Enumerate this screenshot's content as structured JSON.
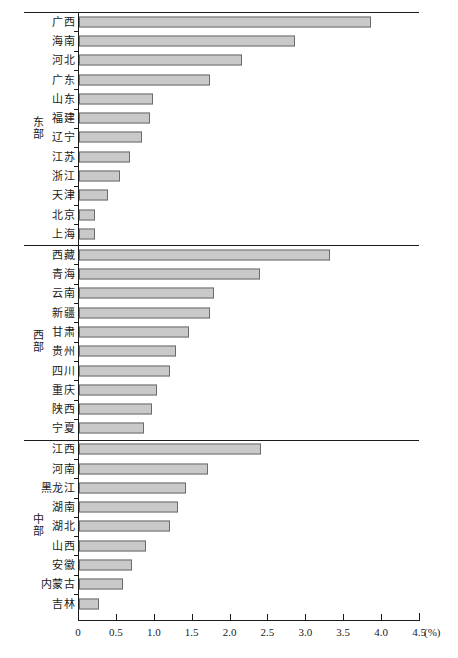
{
  "chart_data": {
    "type": "bar",
    "orientation": "horizontal",
    "title": "",
    "xlabel": "",
    "ylabel": "",
    "unit": "(%)",
    "xlim": [
      0,
      4.5
    ],
    "grid": false,
    "legend": null,
    "xticks": [
      "0",
      "0.5",
      "1.0",
      "1.5",
      "2.0",
      "2.5",
      "3.0",
      "3.5",
      "4.0",
      "4.5"
    ],
    "xtick_values": [
      0,
      0.5,
      1.0,
      1.5,
      2.0,
      2.5,
      3.0,
      3.5,
      4.0,
      4.5
    ],
    "bar_color": "#c9c9c9",
    "bar_border_color": "#6b6b6b",
    "groups": [
      {
        "name": "东部",
        "name_chars": [
          "东",
          "部"
        ],
        "categories": [
          "广西",
          "海南",
          "河北",
          "广东",
          "山东",
          "福建",
          "辽宁",
          "江苏",
          "浙江",
          "天津",
          "北京",
          "上海"
        ],
        "values": [
          3.85,
          2.85,
          2.15,
          1.73,
          0.98,
          0.94,
          0.83,
          0.67,
          0.54,
          0.38,
          0.21,
          0.21
        ]
      },
      {
        "name": "西部",
        "name_chars": [
          "西",
          "部"
        ],
        "categories": [
          "西藏",
          "青海",
          "云南",
          "新疆",
          "甘肃",
          "贵州",
          "四川",
          "重庆",
          "陕西",
          "宁夏"
        ],
        "values": [
          3.31,
          2.39,
          1.78,
          1.73,
          1.45,
          1.28,
          1.2,
          1.03,
          0.96,
          0.86
        ]
      },
      {
        "name": "中部",
        "name_chars": [
          "中",
          "部"
        ],
        "categories": [
          "江西",
          "河南",
          "黑龙江",
          "湖南",
          "湖北",
          "山西",
          "安徽",
          "内蒙古",
          "吉林"
        ],
        "values": [
          2.4,
          1.7,
          1.41,
          1.3,
          1.2,
          0.89,
          0.7,
          0.58,
          0.27
        ]
      }
    ]
  }
}
